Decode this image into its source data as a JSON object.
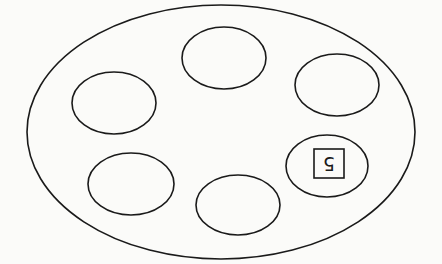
{
  "diagram": {
    "background": "#fbfbf9",
    "stroke_color": "#1a1a1a",
    "outer_ellipse": {
      "cx": 221,
      "cy": 132,
      "rx": 194,
      "ry": 127
    },
    "inner_ellipses": [
      {
        "id": "top",
        "cx": 224,
        "cy": 58,
        "rx": 42,
        "ry": 31,
        "label": ""
      },
      {
        "id": "upper-right",
        "cx": 337,
        "cy": 85,
        "rx": 42,
        "ry": 31,
        "label": ""
      },
      {
        "id": "left",
        "cx": 114,
        "cy": 103,
        "rx": 42,
        "ry": 31,
        "label": ""
      },
      {
        "id": "right",
        "cx": 327,
        "cy": 166,
        "rx": 41,
        "ry": 31,
        "label": "5"
      },
      {
        "id": "bottom-left",
        "cx": 131,
        "cy": 184,
        "rx": 43,
        "ry": 31,
        "label": ""
      },
      {
        "id": "bottom",
        "cx": 238,
        "cy": 205,
        "rx": 42,
        "ry": 30,
        "label": ""
      }
    ],
    "label_box": {
      "x": 314,
      "y": 149,
      "width": 30,
      "height": 29,
      "text": "5",
      "rotation_deg": 180
    }
  }
}
